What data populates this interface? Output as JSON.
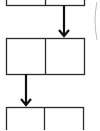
{
  "diagram": {
    "type": "linked-list-cells",
    "stroke_color": "#2b2b2b",
    "faint_curve_color": "#bbbbbb",
    "nodes": [
      {
        "id": "node-1",
        "cells": 2,
        "x": 6,
        "y": -30,
        "w": 78,
        "h": 35,
        "divider_x": 45
      },
      {
        "id": "node-2",
        "cells": 2,
        "x": 6,
        "y": 38,
        "w": 78,
        "h": 36,
        "divider_x": 45
      },
      {
        "id": "node-3",
        "cells": 2,
        "x": 6,
        "y": 107,
        "w": 77,
        "h": 36,
        "divider_x": 44
      }
    ],
    "arrows": [
      {
        "id": "arrow-1-2",
        "x": 64,
        "y1": 5,
        "y2": 36
      },
      {
        "id": "arrow-2-3",
        "x": 26,
        "y1": 74,
        "y2": 105
      }
    ]
  }
}
